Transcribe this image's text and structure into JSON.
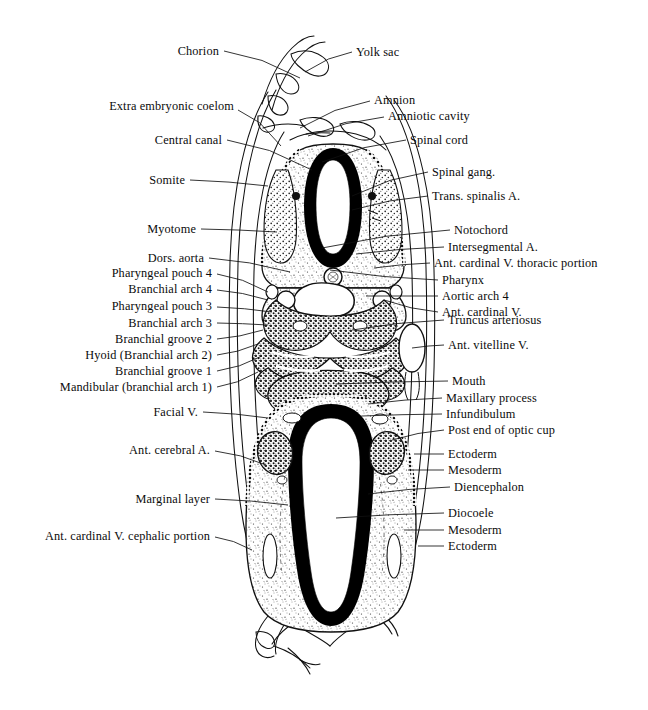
{
  "figure": {
    "ink_color": "#000000",
    "background_color": "#ffffff"
  },
  "labels_left": [
    {
      "text": "Chorion",
      "x": 219,
      "y": 51,
      "lx": 224,
      "ly": 51,
      "tx": 300,
      "ty": 78
    },
    {
      "text": "Extra embryonic coelom",
      "x": 234,
      "y": 106,
      "lx": 238,
      "ly": 110,
      "tx": 281,
      "ty": 146
    },
    {
      "text": "Central canal",
      "x": 222,
      "y": 140,
      "lx": 227,
      "ly": 140,
      "tx": 312,
      "ty": 170
    },
    {
      "text": "Somite",
      "x": 185,
      "y": 180,
      "lx": 190,
      "ly": 180,
      "tx": 268,
      "ty": 186
    },
    {
      "text": "Myotome",
      "x": 196,
      "y": 229,
      "lx": 201,
      "ly": 229,
      "tx": 277,
      "ty": 232
    },
    {
      "text": "Dors. aorta",
      "x": 204,
      "y": 258,
      "lx": 209,
      "ly": 258,
      "tx": 290,
      "ty": 272
    },
    {
      "text": "Pharyngeal pouch 4",
      "x": 212,
      "y": 273,
      "lx": 217,
      "ly": 274,
      "tx": 268,
      "ty": 292
    },
    {
      "text": "Branchial arch 4",
      "x": 212,
      "y": 289,
      "lx": 217,
      "ly": 290,
      "tx": 268,
      "ty": 300
    },
    {
      "text": "Pharyngeal pouch 3",
      "x": 212,
      "y": 306,
      "lx": 217,
      "ly": 307,
      "tx": 272,
      "ty": 312
    },
    {
      "text": "Branchial arch 3",
      "x": 212,
      "y": 323,
      "lx": 217,
      "ly": 323,
      "tx": 268,
      "ty": 325
    },
    {
      "text": "Branchial groove 2",
      "x": 212,
      "y": 339,
      "lx": 217,
      "ly": 339,
      "tx": 263,
      "ty": 330
    },
    {
      "text": "Hyoid (Branchial arch 2)",
      "x": 212,
      "y": 355,
      "lx": 217,
      "ly": 355,
      "tx": 258,
      "ty": 344
    },
    {
      "text": "Branchial groove 1",
      "x": 212,
      "y": 371,
      "lx": 217,
      "ly": 371,
      "tx": 262,
      "ty": 356
    },
    {
      "text": "Mandibular (branchial arch 1)",
      "x": 212,
      "y": 387,
      "lx": 217,
      "ly": 387,
      "tx": 258,
      "ty": 372
    },
    {
      "text": "Facial V.",
      "x": 198,
      "y": 412,
      "lx": 203,
      "ly": 412,
      "tx": 268,
      "ty": 418
    },
    {
      "text": "Ant. cerebral A.",
      "x": 210,
      "y": 450,
      "lx": 215,
      "ly": 451,
      "tx": 266,
      "ty": 465
    },
    {
      "text": "Marginal layer",
      "x": 210,
      "y": 499,
      "lx": 215,
      "ly": 499,
      "tx": 288,
      "ty": 505
    },
    {
      "text": "Ant. cardinal V. cephalic portion",
      "x": 210,
      "y": 536,
      "lx": 215,
      "ly": 537,
      "tx": 252,
      "ty": 550
    }
  ],
  "labels_right": [
    {
      "text": "Yolk sac",
      "x": 356,
      "y": 52,
      "lx": 352,
      "ly": 52,
      "tx": 305,
      "ty": 72
    },
    {
      "text": "Amnion",
      "x": 374,
      "y": 100,
      "lx": 370,
      "ly": 101,
      "tx": 300,
      "ty": 128
    },
    {
      "text": "Amniotic cavity",
      "x": 388,
      "y": 116,
      "lx": 384,
      "ly": 117,
      "tx": 308,
      "ty": 136
    },
    {
      "text": "Spinal cord",
      "x": 410,
      "y": 140,
      "lx": 406,
      "ly": 140,
      "tx": 322,
      "ty": 162
    },
    {
      "text": "Spinal gang.",
      "x": 432,
      "y": 172,
      "lx": 428,
      "ly": 172,
      "tx": 352,
      "ty": 196
    },
    {
      "text": "Trans. spinalis A.",
      "x": 432,
      "y": 196,
      "lx": 428,
      "ly": 196,
      "tx": 352,
      "ty": 210
    },
    {
      "text": "Notochord",
      "x": 454,
      "y": 230,
      "lx": 450,
      "ly": 230,
      "tx": 322,
      "ty": 248
    },
    {
      "text": "Intersegmental A.",
      "x": 448,
      "y": 247,
      "lx": 444,
      "ly": 247,
      "tx": 356,
      "ty": 254
    },
    {
      "text": "Ant. cardinal  V. thoracic portion",
      "x": 434,
      "y": 263,
      "lx": 430,
      "ly": 263,
      "tx": 374,
      "ty": 268
    },
    {
      "text": "Pharynx",
      "x": 442,
      "y": 280,
      "lx": 438,
      "ly": 280,
      "tx": 330,
      "ty": 270
    },
    {
      "text": "Aortic arch 4",
      "x": 442,
      "y": 296,
      "lx": 438,
      "ly": 296,
      "tx": 366,
      "ty": 296
    },
    {
      "text": "Ant. cardinal V.",
      "x": 442,
      "y": 312,
      "lx": 438,
      "ly": 312,
      "tx": 384,
      "ty": 300
    },
    {
      "text": "Truncus arteriosus",
      "x": 448,
      "y": 320,
      "lx": 444,
      "ly": 320,
      "tx": 352,
      "ty": 330
    },
    {
      "text": "Ant. vitelline V.",
      "x": 448,
      "y": 345,
      "lx": 444,
      "ly": 345,
      "tx": 412,
      "ty": 348
    },
    {
      "text": "Mouth",
      "x": 452,
      "y": 381,
      "lx": 448,
      "ly": 381,
      "tx": 336,
      "ty": 384
    },
    {
      "text": "Maxillary process",
      "x": 446,
      "y": 398,
      "lx": 442,
      "ly": 398,
      "tx": 368,
      "ty": 404
    },
    {
      "text": "Infundibulum",
      "x": 446,
      "y": 414,
      "lx": 442,
      "ly": 414,
      "tx": 362,
      "ty": 416
    },
    {
      "text": "Post end  of optic cup",
      "x": 448,
      "y": 430,
      "lx": 444,
      "ly": 430,
      "tx": 392,
      "ty": 440
    },
    {
      "text": "Ectoderm",
      "x": 448,
      "y": 454,
      "lx": 444,
      "ly": 454,
      "tx": 414,
      "ty": 454
    },
    {
      "text": "Mesoderm",
      "x": 448,
      "y": 470,
      "lx": 444,
      "ly": 470,
      "tx": 408,
      "ty": 470
    },
    {
      "text": "Diencephalon",
      "x": 454,
      "y": 487,
      "lx": 450,
      "ly": 487,
      "tx": 368,
      "ty": 494
    },
    {
      "text": "Diocoele",
      "x": 448,
      "y": 513,
      "lx": 444,
      "ly": 513,
      "tx": 336,
      "ty": 518
    },
    {
      "text": "Mesoderm",
      "x": 448,
      "y": 530,
      "lx": 444,
      "ly": 530,
      "tx": 404,
      "ty": 530
    },
    {
      "text": "Ectoderm",
      "x": 448,
      "y": 546,
      "lx": 444,
      "ly": 546,
      "tx": 418,
      "ty": 546
    }
  ],
  "structures": {
    "neural_tube": "spinal cord / central canal — thick black oval, upper trunk section",
    "notochord": "small circle beneath neural tube",
    "pharynx": "large white lumen in mid trunk section",
    "branchial_arches": "stippled masses, arches 1-4 with grooves and pouches",
    "diencephalon": "thick black teardrop outline of forebrain, lower head section",
    "diocoele": "white lumen inside diencephalon",
    "membranes": "chorion, amnion and extra-embryonic coelom enclosing the embryo",
    "vitelline_vessel": "small oval vessel lateral to the body wall"
  }
}
